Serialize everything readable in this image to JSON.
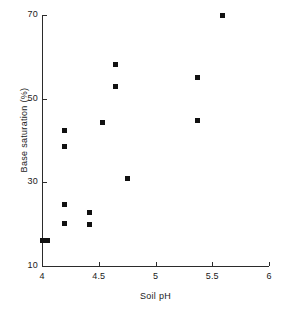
{
  "chart_data": {
    "type": "scatter",
    "title": "",
    "xlabel": "Soil pH",
    "ylabel": "Base saturation (%)",
    "xlim": [
      4,
      6
    ],
    "ylim": [
      10,
      70
    ],
    "xticks": [
      4,
      4.5,
      5,
      5.5,
      6
    ],
    "xtick_labels": [
      "4",
      "4.5",
      "5",
      "5.5",
      "6"
    ],
    "yticks": [
      10,
      30,
      50,
      70
    ],
    "ytick_labels": [
      "10",
      "30",
      "50",
      "70"
    ],
    "grid": false,
    "legend": null,
    "marker": {
      "shape": "square",
      "color": "#111111",
      "size_px": 5
    },
    "series": [
      {
        "name": "Base saturation",
        "points": [
          {
            "x": 4.0,
            "y": 16.0
          },
          {
            "x": 4.05,
            "y": 16.0
          },
          {
            "x": 4.2,
            "y": 42.5
          },
          {
            "x": 4.2,
            "y": 38.6
          },
          {
            "x": 4.2,
            "y": 24.7
          },
          {
            "x": 4.2,
            "y": 20.1
          },
          {
            "x": 4.42,
            "y": 22.8
          },
          {
            "x": 4.42,
            "y": 19.9
          },
          {
            "x": 4.53,
            "y": 44.3
          },
          {
            "x": 4.65,
            "y": 58.2
          },
          {
            "x": 4.65,
            "y": 52.9
          },
          {
            "x": 4.75,
            "y": 31.0
          },
          {
            "x": 5.37,
            "y": 55.1
          },
          {
            "x": 5.37,
            "y": 44.7
          },
          {
            "x": 5.59,
            "y": 69.8
          }
        ]
      }
    ]
  }
}
